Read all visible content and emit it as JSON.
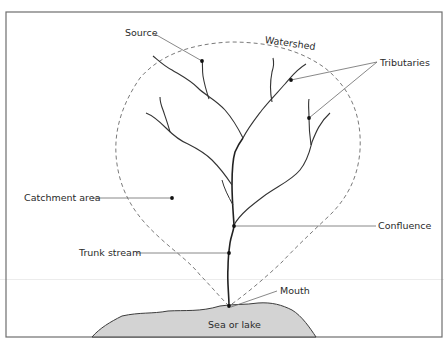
{
  "diagram": {
    "colors": {
      "frame": "#6e6e6e",
      "river": "#333333",
      "watershed_dash": "#7a7a7a",
      "leader_line": "#6a6a6a",
      "sea_fill": "#d3d3d3",
      "sea_outline": "#3c3c3c",
      "text": "#2a2a2a"
    },
    "labels": {
      "source": "Source",
      "watershed": "Watershed",
      "tributaries": "Tributaries",
      "catchment_area": "Catchment area",
      "confluence": "Confluence",
      "trunk_stream": "Trunk stream",
      "mouth": "Mouth",
      "sea_or_lake": "Sea or lake"
    }
  }
}
